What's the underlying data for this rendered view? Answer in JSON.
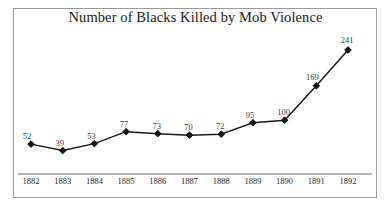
{
  "chart_data": {
    "type": "line",
    "title": "Number of Blacks Killed by Mob Violence",
    "xlabel": "",
    "ylabel": "",
    "categories": [
      "1882",
      "1883",
      "1884",
      "1885",
      "1886",
      "1887",
      "1888",
      "1889",
      "1890",
      "1891",
      "1892"
    ],
    "values": [
      52,
      39,
      53,
      77,
      73,
      70,
      72,
      95,
      100,
      169,
      241
    ],
    "data_labels": [
      "52",
      "39",
      "53",
      "77",
      "73",
      "70",
      "72",
      "95",
      "100",
      "169",
      "241"
    ],
    "ylim": [
      0,
      260
    ],
    "xlim_categories": [
      "1882",
      "1892"
    ],
    "grid": false,
    "legend": false,
    "legend_position": "none",
    "marker": "diamond",
    "line_color": "#1a1a1a",
    "marker_color": "#111111",
    "axis_color": "#6f6f6f",
    "label_color": "#3b3b3b",
    "title_color": "#1b1b1b",
    "border_color": "#9a9a9a",
    "background_color": "#ffffff",
    "annotations": []
  },
  "figure": {
    "frame_label": "chart-frame",
    "axis_label": "x-axis-baseline"
  }
}
